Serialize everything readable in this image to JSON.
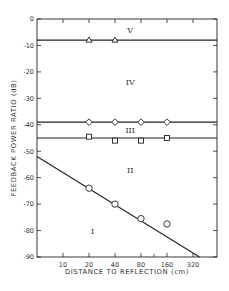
{
  "chart_data": {
    "type": "line",
    "title": "",
    "xlabel": "DISTANCE TO REFLECTION (cm)",
    "ylabel": "FEEDBACK POWER RATIO (dB)",
    "xscale": "log2",
    "x_ticks": [
      "10",
      "20",
      "40",
      "80",
      "160",
      "320"
    ],
    "y_ticks": [
      "0",
      "-10",
      "-20",
      "-30",
      "-40",
      "-50",
      "-60",
      "-70",
      "-80",
      "-90"
    ],
    "ylim": [
      -90,
      0
    ],
    "grid": false,
    "legend": null,
    "regions": [
      {
        "label": "V",
        "x": 60,
        "y": -4
      },
      {
        "label": "IV",
        "x": 60,
        "y": -24
      },
      {
        "label": "III",
        "x": 60,
        "y": -42
      },
      {
        "label": "II",
        "x": 60,
        "y": -57
      },
      {
        "label": "I",
        "x": 22,
        "y": -80
      }
    ],
    "series": [
      {
        "name": "boundary V/IV",
        "marker": "triangle",
        "line": "horizontal",
        "line_y": -8,
        "x": [
          20,
          40
        ],
        "y": [
          -8,
          -8
        ]
      },
      {
        "name": "boundary IV/III",
        "marker": "diamond",
        "line": "horizontal",
        "line_y": -39,
        "x": [
          20,
          40,
          80,
          160
        ],
        "y": [
          -39,
          -39,
          -39,
          -39
        ]
      },
      {
        "name": "boundary III/II",
        "marker": "square",
        "line": "horizontal",
        "line_y": -45,
        "x": [
          20,
          40,
          80,
          160
        ],
        "y": [
          -44.5,
          -46,
          -46,
          -45
        ]
      },
      {
        "name": "boundary II/I",
        "marker": "circle",
        "line": "sloped",
        "line_points": [
          [
            5,
            -52
          ],
          [
            380,
            -90
          ]
        ],
        "x": [
          20,
          40,
          80,
          160
        ],
        "y": [
          -64,
          -70,
          -75.5,
          -77.5
        ]
      }
    ]
  }
}
